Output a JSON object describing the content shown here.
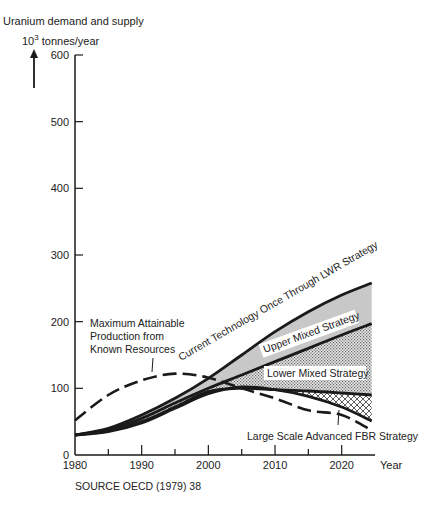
{
  "chart_data": {
    "type": "line",
    "title": "Uranium demand and supply",
    "ylabel": "10^3 tonnes/year",
    "xlabel": "Year",
    "xlim": [
      1980,
      2025
    ],
    "ylim": [
      0,
      600
    ],
    "x_ticks": [
      1980,
      1990,
      2000,
      2010,
      2020
    ],
    "y_ticks": [
      0,
      100,
      200,
      300,
      400,
      500,
      600
    ],
    "grid": false,
    "legend": "inline annotations",
    "x": [
      1980,
      1985,
      1990,
      1995,
      2000,
      2005,
      2010,
      2015,
      2020,
      2024.5
    ],
    "series": [
      {
        "name": "Current Technology Once Through LWR Strategy",
        "style": "solid",
        "values": [
          30,
          40,
          60,
          85,
          115,
          150,
          185,
          215,
          240,
          258
        ]
      },
      {
        "name": "Upper Mixed Strategy",
        "style": "solid",
        "values": [
          30,
          38,
          55,
          78,
          100,
          120,
          140,
          160,
          180,
          197
        ]
      },
      {
        "name": "Lower Mixed Strategy",
        "style": "solid",
        "values": [
          30,
          36,
          50,
          72,
          95,
          100,
          98,
          96,
          93,
          90
        ]
      },
      {
        "name": "Large Scale Advanced FBR Strategy",
        "style": "solid",
        "values": [
          30,
          35,
          48,
          70,
          92,
          102,
          98,
          88,
          72,
          51
        ]
      },
      {
        "name": "Maximum Attainable Production from Known Resources",
        "style": "dashed",
        "values": [
          52,
          90,
          112,
          122,
          116,
          100,
          85,
          67,
          60,
          37
        ]
      }
    ],
    "regions": [
      {
        "between": [
          "Current Technology Once Through LWR Strategy",
          "Upper Mixed Strategy"
        ],
        "fill": "light-grey"
      },
      {
        "between": [
          "Upper Mixed Strategy",
          "Lower Mixed Strategy"
        ],
        "fill": "stipple"
      },
      {
        "between": [
          "Lower Mixed Strategy",
          "Large Scale Advanced FBR Strategy"
        ],
        "fill": "crosshatch"
      }
    ],
    "annotations": [
      "Maximum Attainable Production from Known Resources",
      "Current Technology Once Through LWR Strategy",
      "Upper Mixed Strategy",
      "Lower Mixed Strategy",
      "Large Scale Advanced FBR Strategy"
    ],
    "source": "SOURCE OECD (1979) 38"
  },
  "labels": {
    "title": "Uranium demand and supply",
    "unit_base": "10",
    "unit_exp": "3",
    "unit_rest": " tonnes/year",
    "x_unit": "Year",
    "source": "SOURCE OECD (1979)  38",
    "max_prod_1": "Maximum Attainable",
    "max_prod_2": "Production from",
    "max_prod_3": "Known Resources",
    "lwr": "Current Technology Once Through LWR Strategy",
    "upper": "Upper Mixed Strategy",
    "lower": "Lower Mixed Strategy",
    "fbr": "Large Scale Advanced FBR Strategy"
  },
  "colors": {
    "ink": "#1a1a1a",
    "light_fill": "#c8c8c8",
    "stipple": "#9a9a9a",
    "hatch": "#333333"
  }
}
